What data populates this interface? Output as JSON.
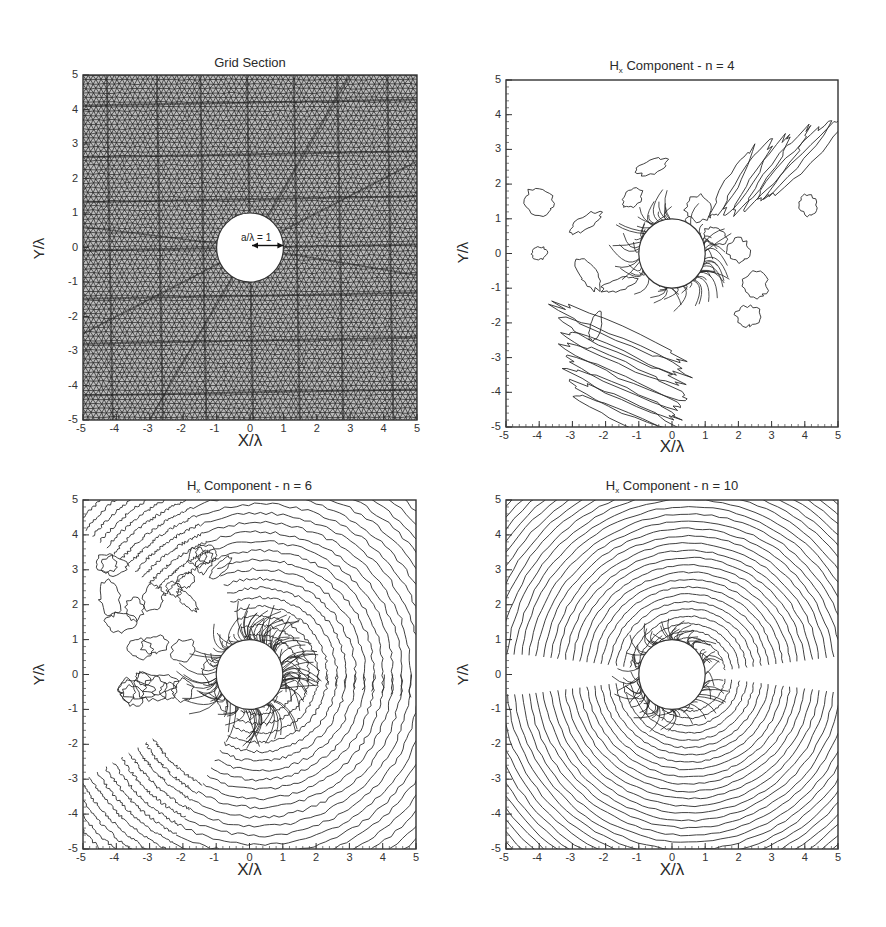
{
  "figure": {
    "panels": [
      {
        "id": "grid-section",
        "title": "Grid Section",
        "title_sub": "",
        "title_rest": "",
        "xlabel": "X/λ",
        "ylabel": "Y/λ",
        "annotation": "a/λ = 1"
      },
      {
        "id": "hx-n4",
        "title": "H",
        "title_sub": "x",
        "title_rest": " Component - n = 4",
        "xlabel": "X/λ",
        "ylabel": "Y/λ"
      },
      {
        "id": "hx-n6",
        "title": "H",
        "title_sub": "x",
        "title_rest": " Component - n = 6",
        "xlabel": "X/λ",
        "ylabel": "Y/λ"
      },
      {
        "id": "hx-n10",
        "title": "H",
        "title_sub": "x",
        "title_rest": " Component - n = 10",
        "xlabel": "X/λ",
        "ylabel": "Y/λ"
      }
    ],
    "ticks": [
      "-5",
      "-4",
      "-3",
      "-2",
      "-1",
      "0",
      "1",
      "2",
      "3",
      "4",
      "5"
    ]
  },
  "chart_data": [
    {
      "type": "heatmap",
      "title": "Grid Section",
      "description": "Unstructured triangular mesh around a circular cylinder",
      "xlabel": "X/λ",
      "ylabel": "Y/λ",
      "xlim": [
        -5,
        5
      ],
      "ylim": [
        -5,
        5
      ],
      "x_ticks": [
        -5,
        -4,
        -3,
        -2,
        -1,
        0,
        1,
        2,
        3,
        4,
        5
      ],
      "y_ticks": [
        -5,
        -4,
        -3,
        -2,
        -1,
        0,
        1,
        2,
        3,
        4,
        5
      ],
      "cylinder": {
        "center": [
          0,
          0
        ],
        "radius": 1
      },
      "annotations": [
        "a/λ = 1"
      ],
      "grid": false
    },
    {
      "type": "line",
      "subtype": "contour",
      "title": "Hx Component - n = 4",
      "xlabel": "X/λ",
      "ylabel": "Y/λ",
      "xlim": [
        -5,
        5
      ],
      "ylim": [
        -5,
        5
      ],
      "x_ticks": [
        -5,
        -4,
        -3,
        -2,
        -1,
        0,
        1,
        2,
        3,
        4,
        5
      ],
      "y_ticks": [
        -5,
        -4,
        -3,
        -2,
        -1,
        0,
        1,
        2,
        3,
        4,
        5
      ],
      "cylinder": {
        "center": [
          0,
          0
        ],
        "radius": 1
      },
      "description": "Scattered field contours, waves propagating toward lower-left and upper-right"
    },
    {
      "type": "line",
      "subtype": "contour",
      "title": "Hx Component - n = 6",
      "xlabel": "X/λ",
      "ylabel": "Y/λ",
      "xlim": [
        -5,
        5
      ],
      "ylim": [
        -5,
        5
      ],
      "x_ticks": [
        -5,
        -4,
        -3,
        -2,
        -1,
        0,
        1,
        2,
        3,
        4,
        5
      ],
      "y_ticks": [
        -5,
        -4,
        -3,
        -2,
        -1,
        0,
        1,
        2,
        3,
        4,
        5
      ],
      "cylinder": {
        "center": [
          0,
          0
        ],
        "radius": 1
      },
      "description": "Concentric scattered wave fronts filling most of the domain"
    },
    {
      "type": "line",
      "subtype": "contour",
      "title": "Hx Component - n = 10",
      "xlabel": "X/λ",
      "ylabel": "Y/λ",
      "xlim": [
        -5,
        5
      ],
      "ylim": [
        -5,
        5
      ],
      "x_ticks": [
        -5,
        -4,
        -3,
        -2,
        -1,
        0,
        1,
        2,
        3,
        4,
        5
      ],
      "y_ticks": [
        -5,
        -4,
        -3,
        -2,
        -1,
        0,
        1,
        2,
        3,
        4,
        5
      ],
      "cylinder": {
        "center": [
          0,
          0
        ],
        "radius": 1
      },
      "description": "Fully developed concentric contours centred near (0.5,0), symmetric about y=0 with a null band along y=0 on the left"
    }
  ]
}
